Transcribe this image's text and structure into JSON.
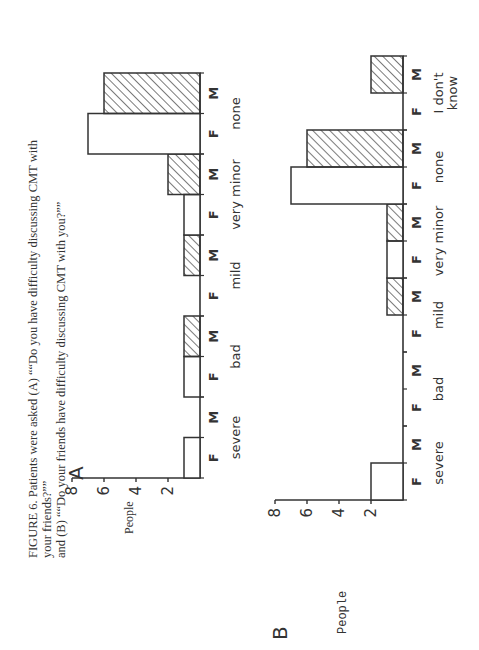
{
  "caption": {
    "line1": "FIGURE 6. Patients were asked (A) ““Do you have difficulty discussing CMT with your friends?””",
    "line2": "and (B) ““Do your friends have difficulty discussing CMT with you?””"
  },
  "panels": {
    "A": {
      "letter": "A",
      "ylabel": "People"
    },
    "B": {
      "letter": "B",
      "ylabel": "People"
    }
  },
  "colors": {
    "ink": "#333333",
    "background": "#ffffff"
  },
  "chart_data": [
    {
      "type": "bar",
      "panel": "A",
      "title": "Do you have difficulty discussing CMT with your friends?",
      "xlabel": "",
      "ylabel": "People",
      "ylim": [
        0,
        8
      ],
      "yticks": [
        2,
        4,
        6,
        8
      ],
      "categories": [
        "severe",
        "bad",
        "mild",
        "very minor",
        "none"
      ],
      "subcategories": [
        "F",
        "M"
      ],
      "series": [
        {
          "name": "F",
          "pattern": "open",
          "values": [
            1,
            1,
            0,
            1,
            7
          ]
        },
        {
          "name": "M",
          "pattern": "hatched",
          "values": [
            0,
            1,
            1,
            2,
            6
          ]
        }
      ],
      "grid": false,
      "orientation": "rotated 90 degrees counter-clockwise on page"
    },
    {
      "type": "bar",
      "panel": "B",
      "title": "Do your friends have difficulty discussing CMT with you?",
      "xlabel": "",
      "ylabel": "People",
      "ylim": [
        0,
        8
      ],
      "yticks": [
        2,
        4,
        6,
        8
      ],
      "categories": [
        "severe",
        "bad",
        "mild",
        "very minor",
        "none",
        "I don't know"
      ],
      "subcategories": [
        "F",
        "M"
      ],
      "series": [
        {
          "name": "F",
          "pattern": "open",
          "values": [
            2,
            0,
            0,
            1,
            7,
            0
          ]
        },
        {
          "name": "M",
          "pattern": "hatched",
          "values": [
            0,
            0,
            1,
            1,
            6,
            2
          ]
        }
      ],
      "grid": false,
      "orientation": "rotated 90 degrees counter-clockwise on page"
    }
  ]
}
